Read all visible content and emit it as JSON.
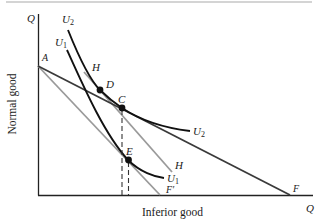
{
  "figure": {
    "type": "economics-indifference-curve-diagram",
    "x_axis": {
      "title": "Inferior good",
      "end_label": "Q"
    },
    "y_axis": {
      "title": "Normal good",
      "end_label": "Q"
    },
    "colors": {
      "dark_line": "#333333",
      "gray_line": "#9a9a9a",
      "curve": "#111111",
      "rule": "#aaaaaa"
    },
    "budget_lines": [
      {
        "id": "AF",
        "from_label": "A",
        "to_label": "F",
        "color": "dark"
      },
      {
        "id": "AF'",
        "from_label": "A",
        "to_label": "F′",
        "color": "gray"
      },
      {
        "id": "H",
        "label": "H",
        "color": "gray",
        "note": "parallel to AF′, tangent at C"
      }
    ],
    "indifference_curves": [
      {
        "name": "U",
        "subscript": "2",
        "points": [
          "D",
          "C"
        ]
      },
      {
        "name": "U",
        "subscript": "1",
        "points": [
          "E"
        ]
      }
    ],
    "points": [
      {
        "label": "A"
      },
      {
        "label": "D"
      },
      {
        "label": "C"
      },
      {
        "label": "E"
      },
      {
        "label": "F"
      },
      {
        "label": "F′"
      },
      {
        "label": "H"
      }
    ],
    "labels": {
      "q_y": "Q",
      "q_x": "Q",
      "u2_top": "U",
      "u2_top_sub": "2",
      "u1_top": "U",
      "u1_top_sub": "1",
      "u2_right": "U",
      "u2_right_sub": "2",
      "u1_right": "U",
      "u1_right_sub": "1",
      "a": "A",
      "d": "D",
      "c": "C",
      "e": "E",
      "f": "F",
      "f_prime": "F′",
      "h_top": "H",
      "h_bottom": "H"
    }
  }
}
